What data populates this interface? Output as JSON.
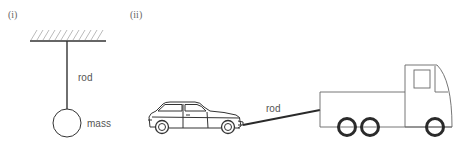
{
  "figure": {
    "panels": [
      {
        "id": "i",
        "label": "(i)",
        "description": "Mass hanging from a fixed support by a rod",
        "labels": {
          "rod": "rod",
          "mass": "mass"
        }
      },
      {
        "id": "ii",
        "label": "(ii)",
        "description": "Car towed by a truck using a rod",
        "labels": {
          "rod": "rod"
        }
      }
    ],
    "colors": {
      "line": "#333333",
      "hatch": "#999999",
      "text": "#555555",
      "wheel": "#2a2a2a"
    }
  }
}
